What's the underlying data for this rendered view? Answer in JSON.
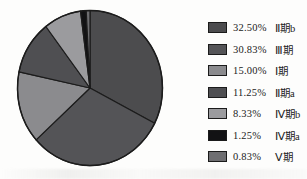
{
  "chart_data": {
    "type": "pie",
    "title": "",
    "direction": "clockwise",
    "start_angle_deg_from_top": 0,
    "legend_position": "right",
    "outline_color": "#1c1c1c",
    "background_color": "#fdfdfc",
    "slices": [
      {
        "label": "Ⅱ期b",
        "percent_label": "32.50%",
        "value": 32.5,
        "color": "#4c4c4e"
      },
      {
        "label": "Ⅲ期",
        "percent_label": "30.83%",
        "value": 30.83,
        "color": "#545457"
      },
      {
        "label": "Ⅰ期",
        "percent_label": "15.00%",
        "value": 15.0,
        "color": "#8b8b8e"
      },
      {
        "label": "Ⅱ期a",
        "percent_label": "11.25%",
        "value": 11.25,
        "color": "#4f4f52"
      },
      {
        "label": "Ⅳ期b",
        "percent_label": "8.33%",
        "value": 8.33,
        "color": "#9b9b9e"
      },
      {
        "label": "Ⅳ期a",
        "percent_label": "1.25%",
        "value": 1.25,
        "color": "#121214"
      },
      {
        "label": "Ⅴ期",
        "percent_label": "0.83%",
        "value": 0.83,
        "color": "#6e6e71"
      }
    ]
  }
}
